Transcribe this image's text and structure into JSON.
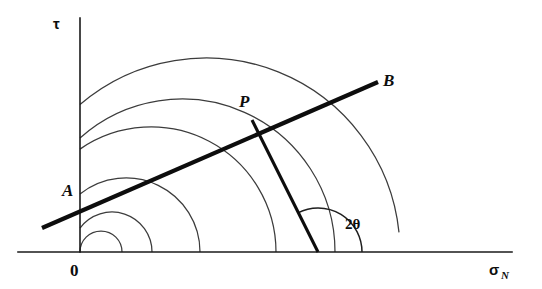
{
  "figure": {
    "background_color": "#ffffff",
    "line_color": "#0d0d0d",
    "circle_color": "#3c3c3c",
    "width": 542,
    "height": 289
  },
  "axes": {
    "vertical": {
      "label": "τ",
      "name": "shear-stress-axis",
      "x": 80,
      "y_top": 18,
      "y_bottom": 252,
      "label_x": 59,
      "label_y": 28
    },
    "horizontal": {
      "label": "σ",
      "subscript": "N",
      "name": "normal-stress-axis",
      "y": 252,
      "x_left": 18,
      "x_right": 512,
      "label_x": 489,
      "label_y": 274
    },
    "origin": {
      "label": "0",
      "x": 73,
      "y": 273
    }
  },
  "labels": {
    "envelope_start": "A",
    "envelope_start_x": 64,
    "envelope_start_y": 196,
    "envelope_end": "B",
    "envelope_end_x": 385,
    "envelope_end_y": 85,
    "tangent_point": "P",
    "tangent_point_x": 241,
    "tangent_point_y": 106,
    "angle": "2θ",
    "angle_x": 345,
    "angle_y": 228
  },
  "chart_data": {
    "type": "line",
    "xlabel": "σ_N",
    "ylabel": "τ",
    "grid": false,
    "legend": null,
    "axis_origin_px": [
      80,
      252
    ],
    "envelope": {
      "name": "failure-envelope-AB",
      "x1": 42,
      "y1": 228,
      "x2": 378,
      "y2": 82,
      "endpoint_labels": [
        "A",
        "B"
      ]
    },
    "circles": [
      {
        "name": "mohr-circle-1",
        "cx": 101,
        "cy": 252,
        "r": 21,
        "left_px": 80,
        "right_px": 122
      },
      {
        "name": "mohr-circle-2",
        "cx": 112,
        "cy": 252,
        "r": 40,
        "left_px": 72,
        "right_px": 152
      },
      {
        "name": "mohr-circle-3",
        "cx": 126,
        "cy": 252,
        "r": 74,
        "left_px": 52,
        "right_px": 200
      },
      {
        "name": "mohr-circle-4",
        "cx": 151,
        "cy": 252,
        "r": 125,
        "left_px": 26,
        "right_px": 276
      },
      {
        "name": "mohr-circle-5",
        "cx": 182,
        "cy": 252,
        "r": 153,
        "left_px": 29,
        "right_px": 335
      },
      {
        "name": "mohr-circle-6",
        "cx": 206,
        "cy": 252,
        "r": 194,
        "left_px": 12,
        "right_px": 400
      }
    ],
    "radius_line": {
      "name": "radius-to-P",
      "x1": 252,
      "y1": 120,
      "x2": 318,
      "y2": 252,
      "from_label": "P",
      "to_label": "circle-center"
    },
    "angle_arc": {
      "name": "angle-2theta-arc",
      "center_x": 318,
      "center_y": 252,
      "radius": 44,
      "label": "2θ",
      "start_angle_deg": 0,
      "end_angle_deg": 117
    }
  }
}
